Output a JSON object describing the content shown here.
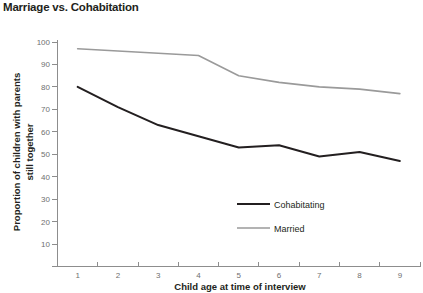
{
  "chart_data": {
    "type": "line",
    "title": "Marriage vs. Cohabitation",
    "xlabel": "Child age at time of interview",
    "ylabel": "Proportion of children with parents still together",
    "x": [
      1,
      2,
      3,
      4,
      5,
      6,
      7,
      8,
      9
    ],
    "xticklabels": [
      "1",
      "2",
      "3",
      "4",
      "5",
      "6",
      "7",
      "8",
      "9"
    ],
    "yticklabels": [
      "10",
      "20",
      "30",
      "40",
      "50",
      "60",
      "70",
      "80",
      "90",
      "100"
    ],
    "yticks": [
      10,
      20,
      30,
      40,
      50,
      60,
      70,
      80,
      90,
      100
    ],
    "xlim": [
      0.5,
      9.5
    ],
    "ylim": [
      0,
      100
    ],
    "grid": false,
    "legend_position": "lower right",
    "series": [
      {
        "name": "Cohabitating",
        "color": "#231f20",
        "values": [
          80,
          71,
          63,
          58,
          53,
          54,
          49,
          51,
          47
        ]
      },
      {
        "name": "Married",
        "color": "#9a9a9a",
        "values": [
          97,
          96,
          95,
          94,
          85,
          82,
          80,
          79,
          77
        ]
      }
    ]
  },
  "legend": {
    "items": [
      {
        "label": "Cohabitating"
      },
      {
        "label": "Married"
      }
    ]
  },
  "colors": {
    "cohabitating": "#231f20",
    "married": "#9a9a9a",
    "axis": "#8d8d8d",
    "tick_text": "#6f6f6f",
    "title_text": "#231f20",
    "background": "#ffffff"
  }
}
